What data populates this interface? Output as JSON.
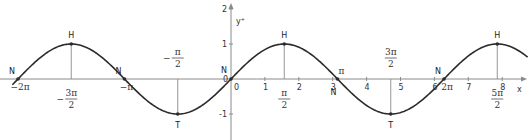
{
  "chart_data": {
    "type": "line",
    "title": "",
    "function": "y = sin(x)",
    "xlabel": "x",
    "ylabel": "y",
    "xlim": [
      -2.35,
      8.7
    ],
    "ylim": [
      -1.4,
      2.2
    ],
    "grid": false,
    "x_ticks": [
      {
        "value": 0,
        "label": "0"
      },
      {
        "value": 1,
        "label": "1"
      },
      {
        "value": 2,
        "label": "2"
      },
      {
        "value": 3,
        "label": "3"
      },
      {
        "value": 4,
        "label": "4"
      },
      {
        "value": 5,
        "label": "5"
      },
      {
        "value": 6,
        "label": "6"
      },
      {
        "value": 7,
        "label": "7"
      },
      {
        "value": 8,
        "label": "8"
      }
    ],
    "y_ticks": [
      {
        "value": 2,
        "label": "2"
      },
      {
        "value": 1,
        "label": "1"
      },
      {
        "value": -1,
        "label": "-1"
      }
    ],
    "special_points": [
      {
        "name": "N",
        "x": -6.2832,
        "y": 0,
        "x_label": "−2π",
        "type": "zero"
      },
      {
        "name": "H",
        "x": -4.7124,
        "y": 1,
        "x_label": "−3π/2",
        "type": "max"
      },
      {
        "name": "N",
        "x": -3.1416,
        "y": 0,
        "x_label": "−π",
        "type": "zero"
      },
      {
        "name": "T",
        "x": -1.5708,
        "y": -1,
        "x_label": "−π/2",
        "type": "min"
      },
      {
        "name": "N",
        "x": 0,
        "y": 0,
        "x_label": "0",
        "type": "zero"
      },
      {
        "name": "H",
        "x": 1.5708,
        "y": 1,
        "x_label": "π/2",
        "type": "max"
      },
      {
        "name": "N",
        "x": 3.1416,
        "y": 0,
        "x_label": "π",
        "type": "zero"
      },
      {
        "name": "T",
        "x": 4.7124,
        "y": -1,
        "x_label": "3π/2",
        "type": "min"
      },
      {
        "name": "N",
        "x": 6.2832,
        "y": 0,
        "x_label": "2π",
        "type": "zero"
      },
      {
        "name": "H",
        "x": 7.854,
        "y": 1,
        "x_label": "5π/2",
        "type": "max"
      }
    ],
    "curve_x_range": [
      -6.45,
      8.75
    ]
  },
  "labels": {
    "x_axis": "x",
    "y_axis": "y",
    "origin_zero": "0"
  },
  "colors": {
    "curve": "#2b2b2b",
    "axis": "#8a8a8a",
    "background": "#ffffff"
  }
}
